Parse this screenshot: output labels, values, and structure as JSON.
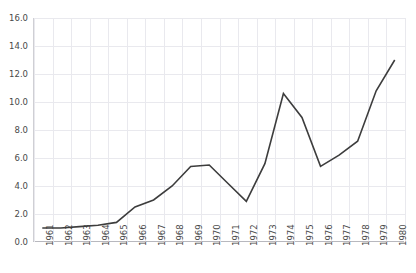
{
  "chart_data": {
    "type": "line",
    "title": "",
    "subtitle": "",
    "xlabel": "",
    "ylabel": "",
    "categories": [
      "1961",
      "1962",
      "1963",
      "1964",
      "1965",
      "1966",
      "1967",
      "1968",
      "1969",
      "1970",
      "1971",
      "1972",
      "1973",
      "1974",
      "1975",
      "1976",
      "1977",
      "1978",
      "1979",
      "1980"
    ],
    "values": [
      1.0,
      1.0,
      1.1,
      1.2,
      1.4,
      2.5,
      3.0,
      4.0,
      5.4,
      5.5,
      4.2,
      2.9,
      5.6,
      10.6,
      8.9,
      5.4,
      6.2,
      7.2,
      10.8,
      13.0
    ],
    "series": [
      {
        "name": "",
        "values": [
          1.0,
          1.0,
          1.1,
          1.2,
          1.4,
          2.5,
          3.0,
          4.0,
          5.4,
          5.5,
          4.2,
          2.9,
          5.6,
          10.6,
          8.9,
          5.4,
          6.2,
          7.2,
          10.8,
          13.0
        ]
      }
    ],
    "ylim": [
      0.0,
      16.0
    ],
    "yticks": [
      0.0,
      2.0,
      4.0,
      6.0,
      8.0,
      10.0,
      12.0,
      14.0,
      16.0
    ],
    "ytick_labels": [
      "0.0",
      "2.0",
      "4.0",
      "6.0",
      "8.0",
      "10.0",
      "12.0",
      "14.0",
      "16.0"
    ],
    "xtick_labels": [
      "1961",
      "1962",
      "1963",
      "1964",
      "1965",
      "1966",
      "1967",
      "1968",
      "1969",
      "1970",
      "1971",
      "1972",
      "1973",
      "1974",
      "1975",
      "1976",
      "1977",
      "1978",
      "1979",
      "1980"
    ],
    "grid": true,
    "legend": false,
    "legend_position": "none",
    "line_color": "#3d3d3d",
    "grid_color": "#e9e9ee",
    "axis_color": "#b8b8be",
    "tick_label_color": "#494949",
    "background_color": "#ffffff",
    "xtick_rotation": 90,
    "annotations": []
  }
}
